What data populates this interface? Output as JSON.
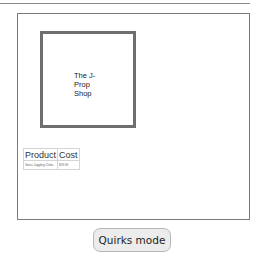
{
  "shop": {
    "name_lines": [
      "The J-",
      "Prop",
      "Shop"
    ]
  },
  "table": {
    "headers": [
      "Product",
      "Cost"
    ],
    "rows": [
      [
        "Swiss Juggling Clubs",
        "$29.99"
      ]
    ]
  },
  "mode_button": {
    "label": "Quirks mode"
  }
}
